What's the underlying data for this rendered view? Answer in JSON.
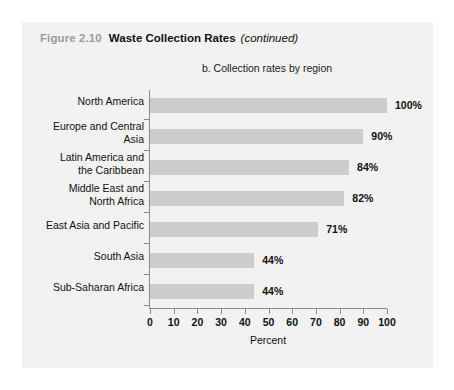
{
  "figure": {
    "number": "Figure 2.10",
    "title": "Waste Collection Rates",
    "continued": "(continued)"
  },
  "colors": {
    "bar_fill": "#cdcdcd",
    "panel_background": "#f2f2f2",
    "axis": "#8a8a8a",
    "figure_number": "#9b9b9b",
    "text": "#111111"
  },
  "chart_data": {
    "type": "bar",
    "orientation": "horizontal",
    "title": "b. Collection rates by region",
    "xlabel": "Percent",
    "ylabel": "",
    "xlim": [
      0,
      100
    ],
    "xticks": [
      0,
      10,
      20,
      30,
      40,
      50,
      60,
      70,
      80,
      90,
      100
    ],
    "xtick_labels": [
      "0",
      "10",
      "20",
      "30",
      "40",
      "50",
      "60",
      "70",
      "80",
      "90",
      "100"
    ],
    "grid": false,
    "legend": false,
    "categories": [
      "North America",
      "Europe and Central Asia",
      "Latin America and the Caribbean",
      "Middle East and North Africa",
      "East Asia and Pacific",
      "South Asia",
      "Sub-Saharan Africa"
    ],
    "category_lines": [
      [
        "North America"
      ],
      [
        "Europe and Central",
        "Asia"
      ],
      [
        "Latin America and",
        "the Caribbean"
      ],
      [
        "Middle East and",
        "North Africa"
      ],
      [
        "East Asia and Pacific"
      ],
      [
        "South Asia"
      ],
      [
        "Sub-Saharan Africa"
      ]
    ],
    "values": [
      100,
      90,
      84,
      82,
      71,
      44,
      44
    ],
    "value_labels": [
      "100%",
      "90%",
      "84%",
      "82%",
      "71%",
      "44%",
      "44%"
    ]
  }
}
